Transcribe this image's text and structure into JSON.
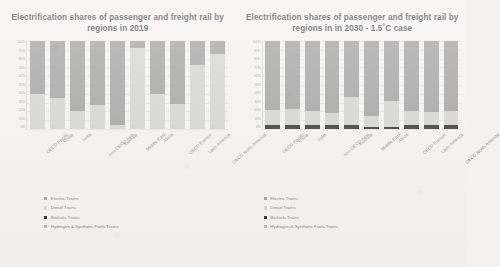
{
  "chart_data": [
    {
      "type": "bar",
      "stacked": true,
      "title": "Electrification shares of passenger and freight rail by regions in 2019",
      "xlabel": "",
      "ylabel": "",
      "ylim": [
        0,
        100
      ],
      "ytick_labels": [
        "100%",
        "90%",
        "80%",
        "70%",
        "60%",
        "50%",
        "40%",
        "30%",
        "20%",
        "10%",
        "0%"
      ],
      "grid": true,
      "legend_position": "bottom-left",
      "categories": [
        "OECD Pacific",
        "China",
        "India",
        "non-OECD Asia",
        "EurAsia",
        "Middle East",
        "Africa",
        "OECD Europe",
        "Latin America",
        "OECD North America"
      ],
      "series": [
        {
          "name": "Electric Trains",
          "color": "#9e9e9e",
          "values": [
            60,
            65,
            80,
            73,
            95,
            8,
            60,
            72,
            27,
            15
          ]
        },
        {
          "name": "Diesel Trains",
          "color": "#d2d2d0",
          "values": [
            40,
            35,
            20,
            27,
            5,
            92,
            40,
            28,
            73,
            85
          ]
        },
        {
          "name": "Biofuels Trains",
          "color": "#2f2f2f",
          "values": [
            0,
            0,
            0,
            0,
            0,
            0,
            0,
            0,
            0,
            0
          ]
        },
        {
          "name": "Hydrogen & Synthetic Fuels Trains",
          "color": "#b3b3b1",
          "values": [
            0,
            0,
            0,
            0,
            0,
            0,
            0,
            0,
            0,
            0
          ]
        }
      ]
    },
    {
      "type": "bar",
      "stacked": true,
      "title": "Electrification shares of passenger and freight rail by regions in in 2030 - 1.5˚C case",
      "xlabel": "",
      "ylabel": "",
      "ylim": [
        0,
        100
      ],
      "ytick_labels": [
        "100%",
        "90%",
        "80%",
        "70%",
        "60%",
        "50%",
        "40%",
        "30%",
        "20%",
        "10%",
        "0%"
      ],
      "grid": true,
      "legend_position": "bottom-left",
      "categories": [
        "OECD Pacific",
        "China",
        "India",
        "non-OECD Asia",
        "EurAsia",
        "Middle East",
        "Africa",
        "OECD Europe",
        "Latin America",
        "OECD North America"
      ],
      "series": [
        {
          "name": "Electric Trains",
          "color": "#9e9e9e",
          "values": [
            78,
            77,
            79,
            82,
            64,
            85,
            68,
            80,
            81,
            80
          ]
        },
        {
          "name": "Diesel Trains",
          "color": "#d2d2d0",
          "values": [
            18,
            19,
            17,
            14,
            32,
            13,
            30,
            16,
            15,
            16
          ]
        },
        {
          "name": "Biofuels Trains",
          "color": "#2f2f2f",
          "values": [
            4,
            4,
            4,
            4,
            4,
            2,
            2,
            4,
            4,
            4
          ]
        },
        {
          "name": "Hydrogen & Synthetic Fuels Trains",
          "color": "#b3b3b1",
          "values": [
            0,
            0,
            0,
            0,
            0,
            0,
            0,
            0,
            0,
            0
          ]
        }
      ]
    }
  ]
}
